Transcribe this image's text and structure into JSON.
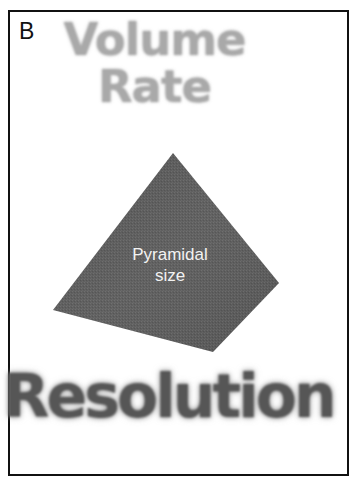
{
  "figure": {
    "panel_label": "B",
    "top_words": {
      "line1": "Volume",
      "line2": "Rate"
    },
    "pyramid": {
      "label_line1": "Pyramidal",
      "label_line2": "size",
      "fill_color": "#5a5a5a"
    },
    "bottom_word": "Resolution",
    "colors": {
      "top_words": "#a9a9a9",
      "bottom_word": "#565656",
      "border": "#111111",
      "background": "#ffffff"
    }
  }
}
